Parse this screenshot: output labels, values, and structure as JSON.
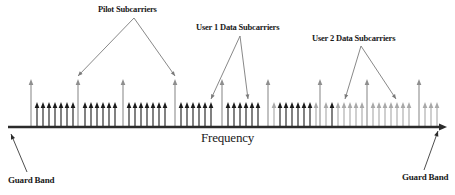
{
  "figure": {
    "title_semantic": "ofdma-subcarrier-allocation-spectrum",
    "axis_label": "Frequency",
    "guard_band_left": "Guard Band",
    "guard_band_right": "Guard Band",
    "annotations": [
      {
        "id": "pilot",
        "text": "Pilot Subcarriers"
      },
      {
        "id": "user1",
        "text": "User 1 Data Subcarriers"
      },
      {
        "id": "user2",
        "text": "User 2 Data Subcarriers"
      }
    ]
  },
  "colors": {
    "axis": "#2b2b2b",
    "pilot": "#8e8e8e",
    "user1": "#1a1a1a",
    "user2": "#a8a8a8",
    "leader": "#7a7a7a",
    "text": "#1a1a1a",
    "background": "#ffffff"
  },
  "geometry": {
    "axis_y": 127,
    "axis_x_start": 8,
    "axis_x_end": 447,
    "pilot_top_y": 80,
    "data_top_y": 103
  },
  "chart_data": {
    "type": "stem",
    "xlabel": "Frequency",
    "ylabel": "",
    "grid": false,
    "legend": [
      "Pilot Subcarriers",
      "User 1 Data Subcarriers",
      "User 2 Data Subcarriers"
    ],
    "series": [
      {
        "name": "Pilot Subcarriers",
        "kind": "pilot",
        "height": 47,
        "x": [
          31,
          78,
          123,
          175,
          222,
          268,
          320,
          367,
          419
        ]
      },
      {
        "name": "User 1 Data Subcarriers",
        "kind": "user1",
        "height": 24,
        "x": [
          37,
          43,
          49,
          55,
          61,
          67,
          73,
          85,
          91,
          97,
          103,
          109,
          115,
          129,
          135,
          141,
          147,
          153,
          159,
          165,
          181,
          187,
          193,
          199,
          205,
          211,
          228,
          234,
          240,
          246,
          252,
          258,
          280,
          286,
          292,
          298,
          304,
          310,
          332
        ]
      },
      {
        "name": "User 2 Data Subcarriers",
        "kind": "user2",
        "height": 24,
        "x": [
          274,
          316,
          326,
          338,
          344,
          350,
          356,
          362,
          373,
          379,
          385,
          391,
          397,
          403,
          409,
          425,
          431,
          437
        ]
      }
    ]
  },
  "leaders": {
    "pilot": {
      "apex_x": 134,
      "apex_y": 18,
      "targets": [
        [
          78,
          76
        ],
        [
          175,
          76
        ]
      ]
    },
    "user1": {
      "apex_x": 240,
      "apex_y": 36,
      "targets": [
        [
          211,
          99
        ],
        [
          248,
          99
        ]
      ]
    },
    "user2": {
      "apex_x": 361,
      "apex_y": 46,
      "targets": [
        [
          345,
          99
        ],
        [
          396,
          99
        ]
      ]
    },
    "guard_left": {
      "from_x": 27,
      "from_y": 172,
      "to_x": 11,
      "to_y": 134
    },
    "guard_right": {
      "from_x": 424,
      "from_y": 170,
      "to_x": 438,
      "to_y": 131
    }
  },
  "label_positions": {
    "pilot": {
      "left": 98,
      "top": 4
    },
    "user1": {
      "left": 196,
      "top": 22
    },
    "user2": {
      "left": 312,
      "top": 33
    },
    "frequency": {
      "left": 201,
      "top": 130
    },
    "guard_left": {
      "left": 8,
      "top": 175
    },
    "guard_right": {
      "left": 402,
      "top": 172
    }
  }
}
